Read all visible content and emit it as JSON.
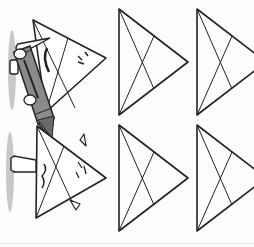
{
  "worksheet": {
    "type": "triangle tracing practice",
    "rows": 2,
    "columns": 2,
    "shape": "triangle-with-medians",
    "example_character": {
      "holding": "crayon",
      "crayon_color": "#8a8a8a"
    }
  },
  "colors": {
    "line": "#222222",
    "shadow": "#b5b5b5",
    "crayon": "#8a8a8a",
    "crayon_dark": "#5a5a5a"
  }
}
